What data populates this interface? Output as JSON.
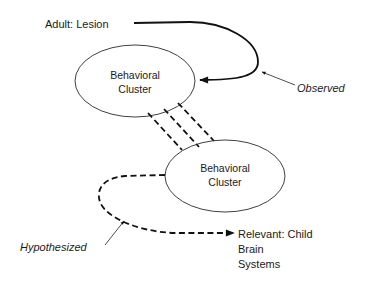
{
  "diagram": {
    "nodes": {
      "adult_lesion": "Adult: Lesion",
      "cluster_top": [
        "Behavioral",
        "Cluster"
      ],
      "cluster_bottom": [
        "Behavioral",
        "Cluster"
      ],
      "relevant": [
        "Relevant: Child",
        "Brain",
        "Systems"
      ]
    },
    "annotations": {
      "observed": "Observed",
      "hypothesized": "Hypothesized"
    },
    "edges": [
      {
        "from": "Adult: Lesion",
        "to": "Behavioral Cluster (top)",
        "style": "solid",
        "label": "Observed"
      },
      {
        "from": "Behavioral Cluster (top)",
        "to": "Behavioral Cluster (bottom)",
        "style": "triple-dashed"
      },
      {
        "from": "Behavioral Cluster (bottom)",
        "to": "Relevant: Child Brain Systems",
        "style": "dashed",
        "label": "Hypothesized"
      }
    ]
  }
}
